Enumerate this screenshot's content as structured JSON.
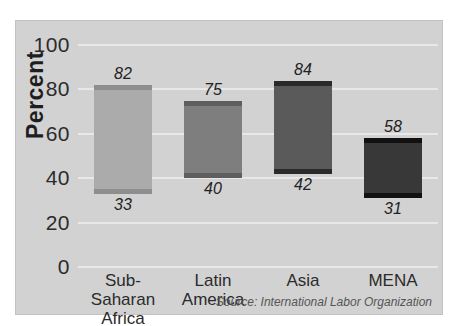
{
  "chart_data": {
    "type": "bar",
    "subtype": "floating-range-bar",
    "title": "",
    "xlabel": "",
    "ylabel": "Percent",
    "ylim": [
      0,
      100
    ],
    "yticks": [
      0,
      20,
      40,
      60,
      80,
      100
    ],
    "ytick_labels": [
      "0",
      "20",
      "40",
      "60",
      "80",
      "100"
    ],
    "grid": true,
    "legend": null,
    "categories": [
      "Sub-\nSaharan Africa",
      "Latin\nAmerica",
      "Asia",
      "MENA"
    ],
    "category_plain": [
      "Sub-Saharan Africa",
      "Latin America",
      "Asia",
      "MENA"
    ],
    "series": [
      {
        "name": "low",
        "values": [
          33,
          40,
          42,
          31
        ]
      },
      {
        "name": "high",
        "values": [
          82,
          75,
          84,
          58
        ]
      }
    ],
    "bars": [
      {
        "category": "Sub-\nSaharan Africa",
        "low": 33,
        "high": 82,
        "low_label": "33",
        "high_label": "82",
        "fill": "#ababab",
        "cap": "#8e8e8e"
      },
      {
        "category": "Latin\nAmerica",
        "low": 40,
        "high": 75,
        "low_label": "40",
        "high_label": "75",
        "fill": "#7e7e7e",
        "cap": "#5e5e5e"
      },
      {
        "category": "Asia",
        "low": 42,
        "high": 84,
        "low_label": "42",
        "high_label": "84",
        "fill": "#5a5a5a",
        "cap": "#2a2a2a"
      },
      {
        "category": "MENA",
        "low": 31,
        "high": 58,
        "low_label": "31",
        "high_label": "58",
        "fill": "#383838",
        "cap": "#111111"
      }
    ],
    "annotations": [
      "Source: International Labor Organization"
    ]
  },
  "axis": {
    "y_title": "Percent",
    "ticks": [
      "100",
      "80",
      "60",
      "40",
      "20",
      "0"
    ]
  },
  "labels": {
    "x": [
      "Sub-\nSaharan Africa",
      "Latin\nAmerica",
      "Asia",
      "MENA"
    ],
    "values_high": [
      "82",
      "75",
      "84",
      "58"
    ],
    "values_low": [
      "33",
      "40",
      "42",
      "31"
    ]
  },
  "footer": {
    "source": "Source: International Labor Organization"
  },
  "colors": {
    "panel_bg": "#d2d2d2",
    "gridline": "#e8e8e8",
    "text": "#2b2b2b",
    "bar1": "#ababab",
    "bar2": "#7e7e7e",
    "bar3": "#5a5a5a",
    "bar4": "#383838"
  }
}
